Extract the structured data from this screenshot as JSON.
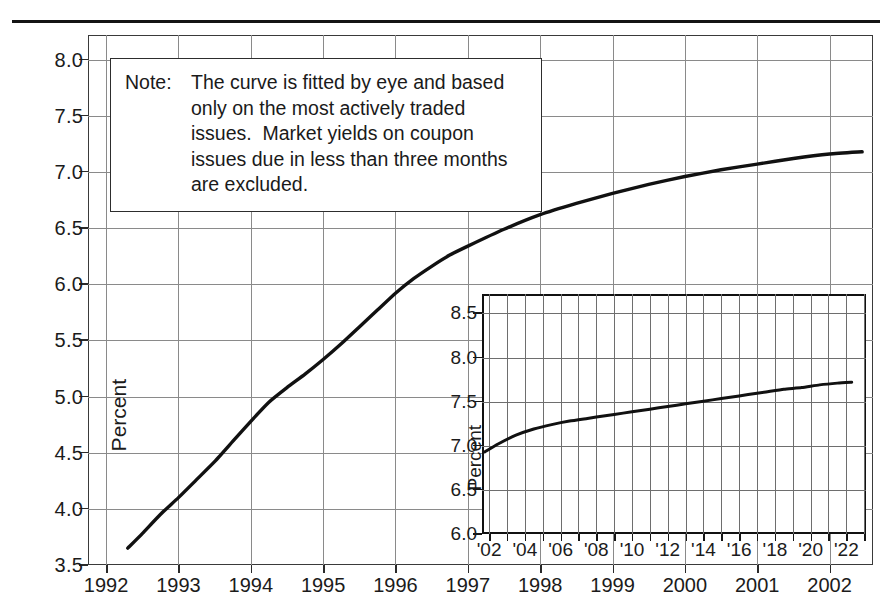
{
  "figure": {
    "note": {
      "label": "Note:",
      "lines": [
        "The curve is fitted by eye and based",
        "only on the most actively traded",
        "issues.  Market yields on coupon",
        "issues due in less than three months",
        "are excluded."
      ]
    }
  },
  "chart_data": [
    {
      "id": "main",
      "type": "line",
      "title": "",
      "xlabel": "",
      "ylabel": "Percent",
      "xlim": [
        1991.75,
        2002.6
      ],
      "ylim": [
        3.5,
        8.22
      ],
      "grid": true,
      "legend": false,
      "y_ticks": [
        "3.5",
        "4.0",
        "4.5",
        "5.0",
        "5.5",
        "6.0",
        "6.5",
        "7.0",
        "7.5",
        "8.0"
      ],
      "y_tick_values": [
        3.5,
        4.0,
        4.5,
        5.0,
        5.5,
        6.0,
        6.5,
        7.0,
        7.5,
        8.0
      ],
      "x_ticks": [
        "1992",
        "1993",
        "1994",
        "1995",
        "1996",
        "1997",
        "1998",
        "1999",
        "2000",
        "2001",
        "2002"
      ],
      "x_tick_values": [
        1992,
        1993,
        1994,
        1995,
        1996,
        1997,
        1998,
        1999,
        2000,
        2001,
        2002
      ],
      "series": [
        {
          "name": "Yield curve",
          "x": [
            1992.3,
            1992.5,
            1992.75,
            1993.0,
            1993.25,
            1993.5,
            1993.75,
            1994.0,
            1994.25,
            1994.5,
            1994.75,
            1995.0,
            1995.25,
            1995.5,
            1995.75,
            1996.0,
            1996.25,
            1996.5,
            1996.75,
            1997.0,
            1997.5,
            1998.0,
            1998.5,
            1999.0,
            1999.5,
            2000.0,
            2000.5,
            2001.0,
            2001.5,
            2002.0,
            2002.45
          ],
          "y": [
            3.65,
            3.78,
            3.95,
            4.1,
            4.26,
            4.42,
            4.6,
            4.78,
            4.95,
            5.08,
            5.2,
            5.33,
            5.47,
            5.62,
            5.77,
            5.92,
            6.05,
            6.16,
            6.26,
            6.34,
            6.49,
            6.62,
            6.72,
            6.81,
            6.89,
            6.96,
            7.02,
            7.07,
            7.12,
            7.16,
            7.18
          ]
        }
      ]
    },
    {
      "id": "inset",
      "type": "line",
      "title": "",
      "xlabel": "",
      "ylabel": "Percent",
      "xlim": [
        2001.6,
        2023.1
      ],
      "ylim": [
        6.0,
        8.72
      ],
      "grid": true,
      "legend": false,
      "y_ticks": [
        "6.0",
        "6.5",
        "7.0",
        "7.5",
        "8.0",
        "8.5"
      ],
      "y_tick_values": [
        6.0,
        6.5,
        7.0,
        7.5,
        8.0,
        8.5
      ],
      "x_ticks": [
        "'02",
        "'04",
        "'06",
        "'08",
        "'10",
        "'12",
        "'14",
        "'16",
        "'18",
        "'20",
        "'22"
      ],
      "x_tick_values": [
        2002,
        2004,
        2006,
        2008,
        2010,
        2012,
        2014,
        2016,
        2018,
        2020,
        2022
      ],
      "x_minor_tick_values": [
        2002,
        2003,
        2004,
        2005,
        2006,
        2007,
        2008,
        2009,
        2010,
        2011,
        2012,
        2013,
        2014,
        2015,
        2016,
        2017,
        2018,
        2019,
        2020,
        2021,
        2022,
        2023
      ],
      "series": [
        {
          "name": "Long-maturity yield curve",
          "x": [
            2001.75,
            2002.5,
            2003.5,
            2004.5,
            2005.5,
            2006.5,
            2007.5,
            2008.5,
            2009.5,
            2010.5,
            2011.5,
            2012.5,
            2013.5,
            2014.5,
            2015.5,
            2016.5,
            2017.5,
            2018.5,
            2019.5,
            2020.5,
            2021.5,
            2022.3
          ],
          "y": [
            6.93,
            7.02,
            7.12,
            7.19,
            7.24,
            7.28,
            7.31,
            7.34,
            7.37,
            7.4,
            7.43,
            7.46,
            7.49,
            7.52,
            7.55,
            7.58,
            7.61,
            7.64,
            7.66,
            7.69,
            7.71,
            7.72
          ]
        }
      ]
    }
  ],
  "colors": {
    "curve": "#111111",
    "gridline": "#8a8a8a",
    "frame": "#3a3a3a",
    "inset_frame": "#111111",
    "text": "#1b1b1b",
    "background": "#ffffff"
  }
}
